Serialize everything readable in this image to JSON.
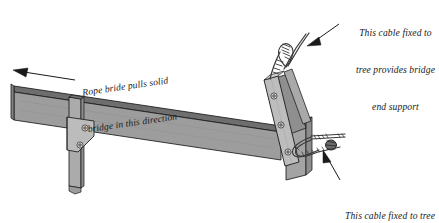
{
  "diagram": {
    "background_color": "#ffffff",
    "ink_color": "#1a1a1a",
    "timber_face_color": "#9a9a9a",
    "timber_top_color": "#6e6e6e",
    "plate_color": "#b4b4b4",
    "post_color": "#a8a8a8",
    "cable_color": "#4d4d4d"
  },
  "annotations": {
    "top_right": {
      "line1": "This cable fixed to",
      "line2": "tree provides bridge",
      "line3": "end support",
      "arrow": "arrow-to-upper-cable"
    },
    "bottom_right": {
      "line1": "This cable fixed to tree",
      "line2": "resists pull of bridge",
      "arrow": "arrow-to-lower-cable"
    },
    "left": {
      "line1": "Rope bride pulls solid",
      "line2": "bridge in this direction",
      "arrow": "arrow-pointing-left"
    }
  },
  "parts": {
    "main_beam": "main-timber-beam",
    "left_post": "left-support-post",
    "left_gusset": "left-gusset-plate",
    "left_bolts": 2,
    "end_post": "angled-end-post",
    "end_plate": "end-steel-plate",
    "end_block": "end-timber-block",
    "end_plate_bolts": 3,
    "upper_cable": "upper-support-cable",
    "lower_cable": "lower-restraint-cable"
  }
}
